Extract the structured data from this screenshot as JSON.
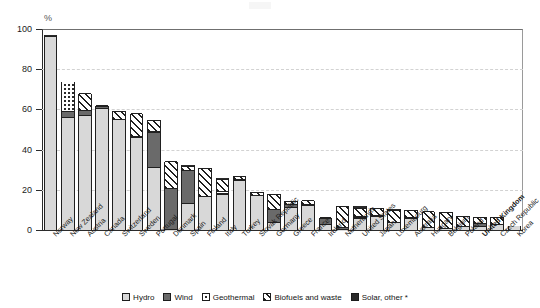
{
  "axis": {
    "unit_label": "%",
    "y_ticks": [
      0,
      20,
      40,
      60,
      80,
      100
    ],
    "y_min": 0,
    "y_max": 100
  },
  "legend": {
    "items": [
      {
        "label": "Hydro",
        "pattern": "solid-light",
        "color": "#d8d8d8"
      },
      {
        "label": "Wind",
        "pattern": "solid-dark",
        "color": "#6a6a6a"
      },
      {
        "label": "Geothermal",
        "pattern": "dotted",
        "color": "#ffffff"
      },
      {
        "label": "Biofuels and waste",
        "pattern": "diagonal-hatch",
        "color": "#ffffff"
      },
      {
        "label": "Solar, other *",
        "pattern": "solid-black-dot",
        "color": "#2a2a2a"
      }
    ]
  },
  "chart_data": {
    "type": "bar",
    "stacked": true,
    "title": "",
    "xlabel": "",
    "ylabel": "%",
    "ylim": [
      0,
      100
    ],
    "grid": true,
    "legend_position": "bottom",
    "categories": [
      "Norway",
      "New Zealand",
      "Austria",
      "Canada",
      "Switzerland",
      "Sweden",
      "Portugal",
      "Denmark",
      "Spain",
      "Finland",
      "Italy",
      "Turkey",
      "Slovak Republic",
      "Germany",
      "Greece",
      "France",
      "Ireland",
      "Netherlands",
      "United States",
      "Japan",
      "Luxembourg",
      "Australia",
      "Hungary",
      "Belgium",
      "Poland",
      "United Kingdom",
      "Czech Republic",
      "Korea"
    ],
    "highlighted_category": "United Kingdom",
    "series": [
      {
        "name": "Hydro",
        "values": [
          96.0,
          55.5,
          56.5,
          60.0,
          54.5,
          46.0,
          31.0,
          0.1,
          13.0,
          16.5,
          17.5,
          24.5,
          17.0,
          3.5,
          11.0,
          12.0,
          2.3,
          0.1,
          5.5,
          6.5,
          3.5,
          5.5,
          0.8,
          0.3,
          1.5,
          1.5,
          2.5,
          1.8
        ]
      },
      {
        "name": "Wind",
        "values": [
          0.0,
          3.0,
          2.5,
          1.0,
          0.2,
          0.5,
          17.5,
          20.5,
          16.5,
          0.1,
          0.4,
          0.2,
          0.1,
          6.5,
          1.5,
          0.4,
          3.2,
          1.0,
          0.5,
          0.1,
          0.2,
          0.3,
          0.1,
          0.4,
          0.2,
          1.5,
          0.2,
          0.0
        ]
      },
      {
        "name": "Geothermal",
        "values": [
          0.0,
          15.0,
          0.0,
          0.0,
          0.1,
          0.0,
          0.2,
          0.0,
          0.0,
          0.0,
          1.2,
          0.0,
          0.0,
          0.0,
          0.0,
          0.0,
          0.0,
          0.0,
          0.4,
          0.3,
          0.0,
          0.1,
          0.0,
          0.0,
          0.0,
          0.0,
          0.0,
          0.0
        ]
      },
      {
        "name": "Biofuels and waste",
        "values": [
          0.0,
          0.0,
          8.5,
          0.5,
          4.0,
          11.0,
          5.5,
          13.0,
          2.0,
          14.0,
          6.0,
          1.8,
          1.5,
          7.5,
          1.5,
          2.0,
          0.3,
          10.5,
          4.0,
          3.5,
          6.0,
          3.5,
          8.0,
          8.0,
          5.0,
          3.0,
          3.5,
          0.0
        ]
      },
      {
        "name": "Solar, other *",
        "values": [
          1.0,
          0.0,
          0.3,
          0.2,
          0.6,
          0.2,
          0.6,
          0.3,
          0.7,
          0.3,
          1.0,
          0.2,
          0.3,
          0.4,
          0.2,
          0.2,
          0.1,
          0.3,
          1.4,
          0.5,
          0.6,
          0.4,
          0.3,
          0.2,
          0.2,
          0.3,
          0.4,
          0.0
        ]
      }
    ],
    "totals": [
      97.0,
      73.5,
      67.8,
      61.7,
      59.4,
      57.7,
      54.8,
      33.9,
      32.2,
      30.9,
      26.1,
      26.7,
      18.9,
      17.9,
      14.2,
      14.6,
      5.9,
      11.9,
      11.8,
      10.9,
      10.3,
      9.8,
      9.2,
      8.9,
      6.9,
      6.3,
      6.6,
      1.8
    ]
  }
}
